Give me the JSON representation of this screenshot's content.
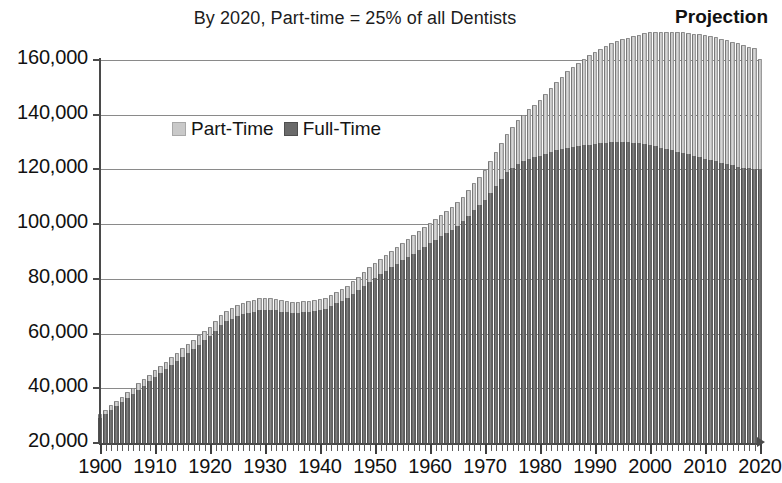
{
  "chart_data": {
    "type": "bar",
    "subtype": "stacked-column",
    "title": "By 2020, Part-time = 25% of all Dentists",
    "annotation": "Projection",
    "xlabel": "",
    "ylabel": "",
    "ylim": [
      20000,
      160000
    ],
    "ytick_values": [
      20000,
      40000,
      60000,
      80000,
      100000,
      120000,
      140000,
      160000
    ],
    "ytick_labels": [
      "20,000",
      "40,000",
      "60,000",
      "80,000",
      "100,000",
      "120,000",
      "140,000",
      "160,000"
    ],
    "xlim": [
      1900,
      2020
    ],
    "xtick_labels": [
      "1900",
      "1910",
      "1920",
      "1930",
      "1940",
      "1950",
      "1960",
      "1970",
      "1980",
      "1990",
      "2000",
      "2010",
      "2020"
    ],
    "xtick_step": 10,
    "minor_xtick_step": 1,
    "grid": "horizontal",
    "legend_position": "inside-upper-left",
    "colors": {
      "part_time": "#c9c9c9",
      "full_time": "#6a6a6a",
      "gridline": "#8a8a8a",
      "axis": "#4a4a4a",
      "background": "#ffffff"
    },
    "legend": [
      {
        "name": "Part-Time",
        "color": "#c9c9c9"
      },
      {
        "name": "Full-Time",
        "color": "#6a6a6a"
      }
    ],
    "categories": [
      1900,
      1901,
      1902,
      1903,
      1904,
      1905,
      1906,
      1907,
      1908,
      1909,
      1910,
      1911,
      1912,
      1913,
      1914,
      1915,
      1916,
      1917,
      1918,
      1919,
      1920,
      1921,
      1922,
      1923,
      1924,
      1925,
      1926,
      1927,
      1928,
      1929,
      1930,
      1931,
      1932,
      1933,
      1934,
      1935,
      1936,
      1937,
      1938,
      1939,
      1940,
      1941,
      1942,
      1943,
      1944,
      1945,
      1946,
      1947,
      1948,
      1949,
      1950,
      1951,
      1952,
      1953,
      1954,
      1955,
      1956,
      1957,
      1958,
      1959,
      1960,
      1961,
      1962,
      1963,
      1964,
      1965,
      1966,
      1967,
      1968,
      1969,
      1970,
      1971,
      1972,
      1973,
      1974,
      1975,
      1976,
      1977,
      1978,
      1979,
      1980,
      1981,
      1982,
      1983,
      1984,
      1985,
      1986,
      1987,
      1988,
      1989,
      1990,
      1991,
      1992,
      1993,
      1994,
      1995,
      1996,
      1997,
      1998,
      1999,
      2000,
      2001,
      2002,
      2003,
      2004,
      2005,
      2006,
      2007,
      2008,
      2009,
      2010,
      2011,
      2012,
      2013,
      2014,
      2015,
      2016,
      2017,
      2018,
      2019,
      2020
    ],
    "series": [
      {
        "name": "Full-Time",
        "values": [
          29000,
          30500,
          32000,
          33500,
          35000,
          36500,
          38000,
          39500,
          41000,
          42500,
          44000,
          45500,
          47000,
          48500,
          50000,
          51500,
          53000,
          54500,
          56000,
          57500,
          59000,
          61000,
          63000,
          64500,
          65500,
          66500,
          67000,
          67500,
          68000,
          68500,
          68500,
          68500,
          68500,
          68000,
          67800,
          67500,
          67500,
          67800,
          68000,
          68200,
          68500,
          69000,
          70000,
          71000,
          72000,
          73000,
          74500,
          76000,
          77500,
          79000,
          80500,
          81800,
          83000,
          84200,
          85500,
          86800,
          88000,
          89200,
          90500,
          91800,
          93000,
          94200,
          95500,
          96800,
          98000,
          99500,
          101000,
          103000,
          105000,
          107000,
          109000,
          111500,
          114000,
          116500,
          119000,
          120500,
          122000,
          123000,
          124000,
          124500,
          125000,
          125800,
          126500,
          127000,
          127500,
          128000,
          128300,
          128600,
          128800,
          129000,
          129200,
          129500,
          129700,
          129900,
          130000,
          130000,
          129900,
          129800,
          129600,
          129400,
          129000,
          128500,
          128000,
          127500,
          127000,
          126500,
          126000,
          125500,
          125000,
          124500,
          124000,
          123500,
          123000,
          122500,
          122000,
          121500,
          121000,
          120700,
          120400,
          120200,
          120000
        ]
      },
      {
        "name": "Part-Time",
        "values": [
          1200,
          1300,
          1400,
          1500,
          1600,
          1700,
          1800,
          1900,
          2000,
          2100,
          2200,
          2300,
          2400,
          2500,
          2600,
          2700,
          2800,
          2900,
          3000,
          3100,
          3200,
          3300,
          3400,
          3500,
          3600,
          3700,
          3800,
          3900,
          4000,
          4000,
          4000,
          4000,
          3900,
          3800,
          3700,
          3600,
          3600,
          3600,
          3600,
          3600,
          3600,
          3600,
          3700,
          3800,
          3900,
          4000,
          4200,
          4400,
          4600,
          4800,
          5000,
          5200,
          5400,
          5600,
          5800,
          6000,
          6200,
          6400,
          6600,
          6800,
          7000,
          7200,
          7400,
          7700,
          8000,
          8300,
          8700,
          9100,
          9500,
          10000,
          10500,
          11200,
          12000,
          12800,
          13700,
          14600,
          15600,
          16600,
          17700,
          18800,
          20000,
          21500,
          23000,
          24500,
          26000,
          27500,
          28800,
          30000,
          31200,
          32300,
          33300,
          34200,
          35000,
          35800,
          36500,
          37200,
          37900,
          38600,
          39300,
          40000,
          40700,
          41300,
          41900,
          42400,
          42900,
          43300,
          43700,
          44000,
          44300,
          44500,
          44700,
          44800,
          44900,
          45000,
          45000,
          44900,
          44700,
          44400,
          44100,
          43900,
          40000
        ]
      }
    ]
  },
  "legend": {
    "part_time_label": "Part-Time",
    "full_time_label": "Full-Time"
  }
}
